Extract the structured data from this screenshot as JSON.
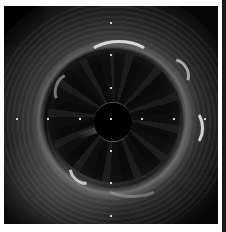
{
  "image": {
    "description": "Intravascular ultrasound (IVUS) grayscale cross-section of a vessel with central catheter",
    "colors": {
      "background": "#050505",
      "border": "#ffffff",
      "echo_bright": "#e6e6e6",
      "calibration_dot": "#cfcfcf"
    },
    "calibration_markers": {
      "horizontal_axis_y": 119,
      "vertical_axis_x": 111,
      "horizontal_x": [
        17,
        48,
        80,
        111,
        142,
        174,
        205
      ],
      "vertical_y": [
        23,
        55,
        88,
        119,
        151,
        183,
        216
      ]
    }
  }
}
